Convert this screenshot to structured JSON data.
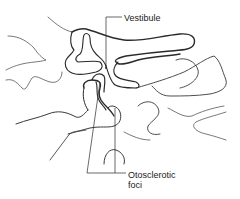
{
  "diagram": {
    "labels": {
      "vestibule": "Vestibule",
      "otosclerotic_foci_line1": "Otosclerotic",
      "otosclerotic_foci_line2": "foci"
    },
    "colors": {
      "line": "#2a2a2a",
      "line_light": "#555555",
      "text": "#222222",
      "background": "#ffffff"
    }
  }
}
